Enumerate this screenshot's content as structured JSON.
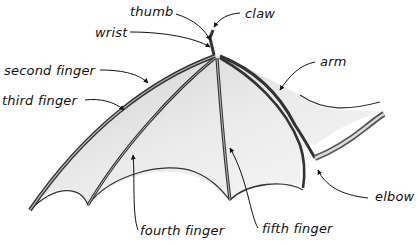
{
  "diagram": {
    "colors": {
      "ink": "#2a2a2a",
      "bone_dark": "#3a3a3a",
      "bone_mid": "#8a8a8a",
      "membrane_shade": "#d4d4d4",
      "membrane_light": "#f2f2f2",
      "background": "#ffffff"
    },
    "labels": [
      {
        "id": "thumb",
        "text": "thumb",
        "x": 130,
        "y": 5
      },
      {
        "id": "claw",
        "text": "claw",
        "x": 245,
        "y": 7
      },
      {
        "id": "wrist",
        "text": "wrist",
        "x": 95,
        "y": 26
      },
      {
        "id": "second-finger",
        "text": "second finger",
        "x": 4,
        "y": 64
      },
      {
        "id": "third-finger",
        "text": "third finger",
        "x": 2,
        "y": 94
      },
      {
        "id": "arm",
        "text": "arm",
        "x": 320,
        "y": 55
      },
      {
        "id": "elbow",
        "text": "elbow",
        "x": 375,
        "y": 190
      },
      {
        "id": "fourth-finger",
        "text": "fourth finger",
        "x": 140,
        "y": 224
      },
      {
        "id": "fifth-finger",
        "text": "fifth finger",
        "x": 262,
        "y": 222
      }
    ]
  }
}
